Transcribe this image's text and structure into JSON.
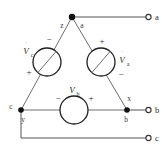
{
  "diagram": {
    "colors": {
      "wire": "#6e6e6e",
      "component_outline": "#1f1f1f",
      "node": "#111111",
      "text": "#2b2b2b",
      "background": "#ffffff"
    }
  },
  "sources": {
    "left": {
      "label": "V",
      "subscript": "c",
      "overdot": "˙",
      "sign_top": "−",
      "sign_bottom": "+"
    },
    "right": {
      "label": "V",
      "subscript": "a",
      "overdot": "˙",
      "sign_top": "+",
      "sign_bottom": "−"
    },
    "bottom": {
      "label": "V",
      "subscript": "b",
      "overdot": "˙",
      "sign_left": "−",
      "sign_right": "+"
    }
  },
  "nodes": {
    "apex_left": "z",
    "apex_right": "a",
    "bottom_left_outer": "c",
    "bottom_left_inner": "y",
    "bottom_right_upper": "x",
    "bottom_right_lower": "b"
  },
  "terminals": [
    {
      "label": "a"
    },
    {
      "label": "b"
    },
    {
      "label": "c"
    }
  ]
}
